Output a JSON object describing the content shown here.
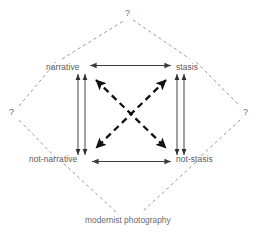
{
  "diagram": {
    "type": "semiotic-square",
    "title": "",
    "colors": {
      "text": "#59595b",
      "apex_text": "#6b6b6d",
      "solid_line": "#3b3b3d",
      "dashed_thin_line": "#8a8a8c",
      "dashed_bold_line": "#1a1a1a",
      "background": "#ffffff"
    },
    "corners": [
      {
        "id": "narrative",
        "label": "narrative",
        "position": "top-left"
      },
      {
        "id": "stasis",
        "label": "stasis",
        "position": "top-right"
      },
      {
        "id": "not-narrative",
        "label": "not-narrative",
        "position": "bottom-left"
      },
      {
        "id": "not-stasis",
        "label": "not-stasis",
        "position": "bottom-right"
      }
    ],
    "apexes": [
      {
        "id": "top",
        "label": "?",
        "position": "top"
      },
      {
        "id": "left",
        "label": "?",
        "position": "left"
      },
      {
        "id": "right",
        "label": "?",
        "position": "right"
      },
      {
        "id": "bottom",
        "label": "modernist photography",
        "position": "bottom"
      }
    ],
    "relations": [
      {
        "id": "narrative-stasis",
        "from": "narrative",
        "to": "stasis",
        "style": "solid",
        "arrows": "both",
        "orientation": "horizontal"
      },
      {
        "id": "not-narrative-not-stasis",
        "from": "not-narrative",
        "to": "not-stasis",
        "style": "solid",
        "arrows": "both",
        "orientation": "horizontal"
      },
      {
        "id": "narrative-not-narrative",
        "from": "narrative",
        "to": "not-narrative",
        "style": "double-line",
        "arrows": "both",
        "orientation": "vertical"
      },
      {
        "id": "stasis-not-stasis",
        "from": "stasis",
        "to": "not-stasis",
        "style": "double-line",
        "arrows": "both",
        "orientation": "vertical"
      },
      {
        "id": "narrative-not-stasis",
        "from": "narrative",
        "to": "not-stasis",
        "style": "dashed-bold",
        "arrows": "both",
        "orientation": "diagonal"
      },
      {
        "id": "stasis-not-narrative",
        "from": "stasis",
        "to": "not-narrative",
        "style": "dashed-bold",
        "arrows": "both",
        "orientation": "diagonal"
      }
    ],
    "outer_diamond": {
      "style": "dashed-thin",
      "edges": [
        {
          "from": "narrative",
          "to": "top"
        },
        {
          "from": "top",
          "to": "stasis"
        },
        {
          "from": "stasis",
          "to": "right"
        },
        {
          "from": "right",
          "to": "not-stasis"
        },
        {
          "from": "not-stasis",
          "to": "bottom"
        },
        {
          "from": "bottom",
          "to": "not-narrative"
        },
        {
          "from": "not-narrative",
          "to": "left"
        },
        {
          "from": "left",
          "to": "narrative"
        }
      ]
    }
  }
}
